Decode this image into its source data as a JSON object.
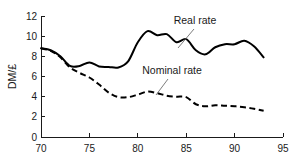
{
  "chart_data": {
    "type": "line",
    "title": "",
    "xlabel": "",
    "ylabel": "DM/£",
    "xlim": [
      70,
      95
    ],
    "ylim": [
      0,
      12
    ],
    "xticks": [
      70,
      75,
      80,
      85,
      90,
      95
    ],
    "yticks": [
      0,
      2,
      4,
      6,
      8,
      10,
      12
    ],
    "xtick_labels": [
      "70",
      "75",
      "80",
      "85",
      "90",
      "95"
    ],
    "ytick_labels": [
      "0",
      "2",
      "4",
      "6",
      "8",
      "10",
      "12"
    ],
    "grid": false,
    "legend_position": "inline-annotations",
    "x": [
      70,
      71,
      72,
      73,
      74,
      75,
      76,
      77,
      78,
      79,
      80,
      81,
      82,
      83,
      84,
      85,
      86,
      87,
      88,
      89,
      90,
      91,
      92,
      93
    ],
    "series": [
      {
        "name": "Real rate",
        "style": "solid",
        "color": "#000000",
        "values": [
          8.8,
          8.6,
          8.0,
          7.05,
          7.05,
          7.4,
          7.0,
          6.95,
          6.9,
          7.5,
          9.4,
          10.5,
          10.1,
          10.2,
          9.4,
          9.7,
          8.6,
          8.2,
          8.9,
          9.2,
          9.2,
          9.55,
          9.0,
          7.9
        ]
      },
      {
        "name": "Nominal rate",
        "style": "dashed",
        "color": "#000000",
        "values": [
          8.8,
          8.55,
          7.9,
          6.9,
          6.35,
          5.9,
          5.2,
          4.4,
          3.95,
          3.95,
          4.2,
          4.5,
          4.35,
          4.1,
          4.0,
          3.95,
          3.25,
          3.05,
          3.15,
          3.1,
          3.05,
          2.95,
          2.8,
          2.6
        ]
      }
    ],
    "annotations": [
      {
        "name": "Real rate",
        "text": "Real rate",
        "text_x": 195,
        "text_y": 24,
        "leader_from_x": 194,
        "leader_from_y": 29,
        "leader_to_x": 178,
        "leader_to_y": 48
      },
      {
        "name": "Nominal rate",
        "text": "Nominal rate",
        "text_x": 172,
        "text_y": 74,
        "leader_from_x": 168,
        "leader_from_y": 79,
        "leader_to_x": 156,
        "leader_to_y": 95
      }
    ]
  },
  "axes_geometry": {
    "plot_left": 41,
    "plot_right": 283,
    "plot_top": 16,
    "plot_bottom": 137,
    "tick_len": 4
  }
}
